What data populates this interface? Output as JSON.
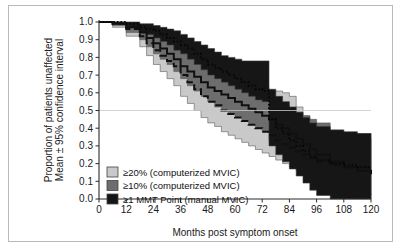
{
  "figure": {
    "border_color": "#b9b9b9",
    "background": "#ffffff"
  },
  "chart_data": {
    "type": "line",
    "title": "",
    "xlabel": "Months post symptom onset",
    "ylabel": "Proportion of patients unaffected\nMean ± 95% confidence interval",
    "ylabel_line1": "Proportion of patients unaffected",
    "ylabel_line2": "Mean ± 95% confidence interval",
    "xlim": [
      0,
      120
    ],
    "ylim": [
      0,
      1
    ],
    "xticks": [
      0,
      12,
      24,
      36,
      48,
      60,
      72,
      84,
      96,
      108,
      120
    ],
    "xticklabels": [
      "0",
      "12",
      "24",
      "36",
      "48",
      "60",
      "72",
      "84",
      "96",
      "108",
      "120"
    ],
    "yticks": [
      0.0,
      0.1,
      0.2,
      0.3,
      0.4,
      0.5,
      0.6,
      0.7,
      0.8,
      0.9,
      1.0
    ],
    "yticklabels": [
      "0.0",
      "0.1",
      "0.2",
      "0.3",
      "0.4",
      "0.5",
      "0.6",
      "0.7",
      "0.8",
      "0.9",
      "1.0"
    ],
    "grid": false,
    "reference_lines": [
      {
        "axis": "y",
        "value": 0.5,
        "color": "#c8c8c8"
      }
    ],
    "legend_position": "lower-left",
    "legend": [
      {
        "label": "≥20% (computerized MVIC)",
        "color": "#c9c9c9"
      },
      {
        "label": "≥10% (computerized MVIC)",
        "color": "#6d6d6d"
      },
      {
        "label": "≥1 MMT Point (manual MVIC)",
        "color": "#161616"
      }
    ],
    "series": [
      {
        "name": "≥20% (computerized MVIC)",
        "band_color": "#c9c9c9",
        "line_style": "dashed",
        "line_color": "#101010",
        "x": [
          0,
          6,
          12,
          18,
          21,
          24,
          27,
          30,
          33,
          36,
          39,
          42,
          45,
          48,
          51,
          54,
          57,
          60,
          63,
          66,
          69,
          72,
          75,
          78,
          81,
          84,
          87,
          90,
          93,
          96,
          102,
          108,
          114,
          120
        ],
        "mean": [
          1.0,
          0.99,
          0.96,
          0.92,
          0.88,
          0.84,
          0.81,
          0.78,
          0.75,
          0.7,
          0.66,
          0.62,
          0.58,
          0.55,
          0.53,
          0.5,
          0.48,
          0.46,
          0.44,
          0.42,
          0.4,
          0.38,
          0.36,
          0.33,
          0.31,
          0.29,
          0.27,
          0.25,
          0.23,
          0.21,
          0.19,
          0.18,
          0.18,
          0.18
        ],
        "lower": [
          1.0,
          0.97,
          0.92,
          0.86,
          0.81,
          0.76,
          0.72,
          0.68,
          0.64,
          0.58,
          0.54,
          0.5,
          0.46,
          0.43,
          0.41,
          0.38,
          0.36,
          0.34,
          0.32,
          0.3,
          0.28,
          0.26,
          0.24,
          0.22,
          0.2,
          0.18,
          0.16,
          0.14,
          0.12,
          0.1,
          0.07,
          0.05,
          0.03,
          0.02
        ],
        "upper": [
          1.0,
          1.0,
          0.99,
          0.97,
          0.95,
          0.92,
          0.9,
          0.88,
          0.86,
          0.82,
          0.78,
          0.74,
          0.7,
          0.67,
          0.65,
          0.63,
          0.61,
          0.6,
          0.59,
          0.58,
          0.58,
          0.57,
          0.6,
          0.61,
          0.6,
          0.58,
          0.52,
          0.47,
          0.43,
          0.4,
          0.38,
          0.37,
          0.37,
          0.37
        ]
      },
      {
        "name": "≥10% (computerized MVIC)",
        "band_color": "#6d6d6d",
        "line_style": "solid",
        "line_color": "#101010",
        "x": [
          0,
          6,
          12,
          18,
          21,
          24,
          27,
          30,
          33,
          36,
          39,
          42,
          45,
          48,
          51,
          54,
          57,
          60,
          63,
          66,
          69,
          72,
          75,
          78,
          81,
          84,
          87,
          90,
          93,
          96,
          102,
          108,
          114,
          120
        ],
        "mean": [
          1.0,
          0.99,
          0.97,
          0.94,
          0.91,
          0.88,
          0.85,
          0.82,
          0.79,
          0.75,
          0.72,
          0.69,
          0.66,
          0.63,
          0.61,
          0.59,
          0.57,
          0.55,
          0.53,
          0.51,
          0.49,
          0.47,
          0.45,
          0.42,
          0.4,
          0.37,
          0.34,
          0.31,
          0.28,
          0.25,
          0.21,
          0.18,
          0.16,
          0.14
        ],
        "lower": [
          1.0,
          0.98,
          0.94,
          0.9,
          0.86,
          0.82,
          0.79,
          0.76,
          0.72,
          0.68,
          0.64,
          0.61,
          0.58,
          0.55,
          0.52,
          0.5,
          0.48,
          0.46,
          0.44,
          0.42,
          0.4,
          0.38,
          0.33,
          0.3,
          0.27,
          0.23,
          0.19,
          0.15,
          0.11,
          0.07,
          0.04,
          0.02,
          0.01,
          0.0
        ],
        "upper": [
          1.0,
          1.0,
          0.99,
          0.98,
          0.96,
          0.94,
          0.92,
          0.9,
          0.88,
          0.85,
          0.82,
          0.79,
          0.77,
          0.75,
          0.73,
          0.71,
          0.7,
          0.68,
          0.67,
          0.65,
          0.64,
          0.63,
          0.57,
          0.55,
          0.53,
          0.51,
          0.49,
          0.47,
          0.45,
          0.43,
          0.39,
          0.36,
          0.34,
          0.33
        ]
      },
      {
        "name": "≥1 MMT Point (manual MVIC)",
        "band_color": "#161616",
        "line_style": "dotted",
        "line_color": "#050505",
        "x": [
          0,
          6,
          12,
          18,
          21,
          24,
          27,
          30,
          33,
          36,
          39,
          42,
          45,
          48,
          51,
          54,
          57,
          60,
          63,
          66,
          69,
          72,
          75,
          78,
          81,
          84,
          87,
          90,
          93,
          96,
          102,
          108,
          114,
          120
        ],
        "mean": [
          1.0,
          1.0,
          0.99,
          0.97,
          0.96,
          0.95,
          0.93,
          0.91,
          0.89,
          0.87,
          0.85,
          0.82,
          0.79,
          0.76,
          0.74,
          0.72,
          0.7,
          0.68,
          0.66,
          0.64,
          0.62,
          0.61,
          0.45,
          0.4,
          0.37,
          0.33,
          0.3,
          0.27,
          0.24,
          0.22,
          0.2,
          0.19,
          0.18,
          0.18
        ],
        "lower": [
          1.0,
          0.99,
          0.97,
          0.94,
          0.93,
          0.91,
          0.89,
          0.87,
          0.84,
          0.82,
          0.79,
          0.76,
          0.73,
          0.7,
          0.68,
          0.66,
          0.64,
          0.62,
          0.6,
          0.58,
          0.56,
          0.55,
          0.3,
          0.25,
          0.21,
          0.17,
          0.13,
          0.09,
          0.05,
          0.02,
          0.0,
          0.0,
          0.0,
          0.0
        ],
        "upper": [
          1.0,
          1.0,
          1.0,
          0.99,
          0.99,
          0.98,
          0.97,
          0.96,
          0.95,
          0.93,
          0.91,
          0.89,
          0.87,
          0.85,
          0.83,
          0.81,
          0.8,
          0.79,
          0.78,
          0.78,
          0.78,
          0.78,
          0.62,
          0.58,
          0.55,
          0.52,
          0.49,
          0.46,
          0.43,
          0.41,
          0.39,
          0.38,
          0.37,
          0.37
        ]
      }
    ]
  }
}
